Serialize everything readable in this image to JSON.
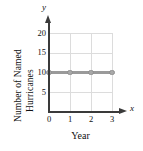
{
  "chart_data": {
    "type": "line",
    "title": "",
    "xlabel": "Year",
    "ylabel_lines": [
      "Number of Named",
      "Hurricanes"
    ],
    "ylabel": "Number of Named Hurricanes",
    "x_axis_variable": "x",
    "y_axis_variable": "y",
    "x": [
      0,
      1,
      2,
      3
    ],
    "values": [
      10,
      10,
      10,
      10
    ],
    "series": [
      {
        "name": "Named hurricanes",
        "values": [
          10,
          10,
          10,
          10
        ]
      }
    ],
    "xlim": [
      0,
      3
    ],
    "ylim": [
      0,
      20
    ],
    "xticks": [
      "0",
      "1",
      "2",
      "3"
    ],
    "xtick_values": [
      0,
      1,
      2,
      3
    ],
    "yticks": [
      "5",
      "10",
      "15",
      "20"
    ],
    "ytick_values": [
      5,
      10,
      15,
      20
    ],
    "grid": true,
    "legend": "none",
    "line_color": "#9a9a9a",
    "marker_color": "#a8a8a8",
    "axis_color": "#3a3a3a",
    "grid_color": "#dcdcdc",
    "background_color": "#ffffff"
  }
}
